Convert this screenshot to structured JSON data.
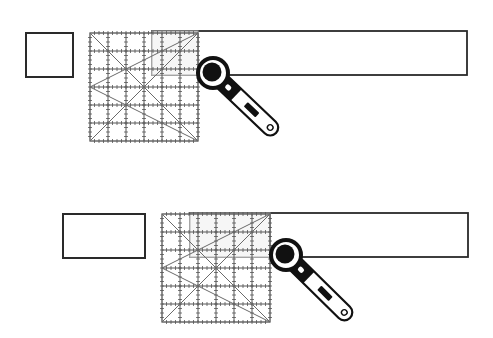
{
  "diagram": {
    "colors": {
      "background": "#ffffff",
      "outline": "#2a2a2a",
      "grid": "#555555",
      "cutter": "#111111"
    },
    "steps": [
      {
        "id": "step-1",
        "cut_piece": {
          "shape": "square",
          "x": 26,
          "y": 33,
          "w": 47,
          "h": 44
        },
        "fabric_strip": {
          "x": 152,
          "y": 31,
          "w": 315,
          "h": 44
        },
        "ruler": {
          "x": 90,
          "y": 33,
          "size": 108,
          "divisions": 6
        },
        "cutter": {
          "cx": 213,
          "cy": 73,
          "handle_end_x": 276,
          "handle_end_y": 133
        }
      },
      {
        "id": "step-2",
        "cut_piece": {
          "shape": "rectangle",
          "x": 63,
          "y": 214,
          "w": 82,
          "h": 44
        },
        "fabric_strip": {
          "x": 190,
          "y": 213,
          "w": 278,
          "h": 44
        },
        "ruler": {
          "x": 162,
          "y": 214,
          "size": 108,
          "divisions": 6
        },
        "cutter": {
          "cx": 286,
          "cy": 255,
          "handle_end_x": 350,
          "handle_end_y": 318
        }
      }
    ]
  }
}
